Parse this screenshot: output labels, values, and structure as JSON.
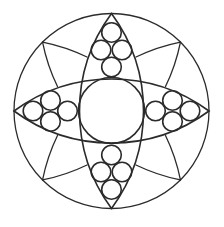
{
  "figure": {
    "colors": {
      "background": "#ffffff",
      "line": "#2b2b2b"
    },
    "lens_count": 2,
    "small_circle_clusters": 4,
    "circles_per_cluster": 4,
    "petal_line_count": 8
  }
}
